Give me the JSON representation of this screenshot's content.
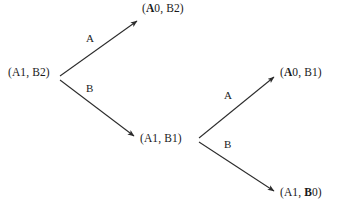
{
  "diagram": {
    "type": "decision-tree",
    "title": "",
    "line_color": "#2b2b2b",
    "text_color": "#1a1a1a",
    "background": "#ffffff",
    "nodes": [
      {
        "id": "root",
        "label": "(A1, B2)",
        "prefix": "(A1, B",
        "changed": "",
        "suffix": "2)",
        "x": 8,
        "y": 66,
        "role": "start-state"
      },
      {
        "id": "top",
        "label": "(A0, B2)",
        "prefix": "(",
        "changed": "A",
        "suffix": "0, B2)",
        "x": 142,
        "y": 2,
        "role": "terminal-state"
      },
      {
        "id": "middle",
        "label": "(A1, B1)",
        "prefix": "(A1, B",
        "changed": "",
        "suffix": "1)",
        "x": 140,
        "y": 132,
        "role": "intermediate-state"
      },
      {
        "id": "upper-right",
        "label": "(A0, B1)",
        "prefix": "(",
        "changed": "A",
        "suffix": "0, B1)",
        "x": 280,
        "y": 66,
        "role": "terminal-state"
      },
      {
        "id": "lower-right",
        "label": "(A1, B0)",
        "prefix": "(A1, ",
        "changed": "B",
        "suffix": "0)",
        "x": 280,
        "y": 186,
        "role": "terminal-state"
      }
    ],
    "edges": [
      {
        "id": "root-to-top",
        "action": "A",
        "from": "root",
        "to": "top",
        "x1": 60,
        "y1": 76,
        "x2": 137,
        "y2": 21,
        "label_x": 86,
        "label_y": 32
      },
      {
        "id": "root-to-middle",
        "action": "B",
        "from": "root",
        "to": "middle",
        "x1": 60,
        "y1": 80,
        "x2": 134,
        "y2": 136,
        "label_x": 86,
        "label_y": 82
      },
      {
        "id": "middle-to-upper-right",
        "action": "A",
        "from": "middle",
        "to": "upper-right",
        "x1": 199,
        "y1": 138,
        "x2": 274,
        "y2": 77,
        "label_x": 224,
        "label_y": 89
      },
      {
        "id": "middle-to-lower-right",
        "action": "B",
        "from": "middle",
        "to": "lower-right",
        "x1": 199,
        "y1": 142,
        "x2": 274,
        "y2": 191,
        "label_x": 224,
        "label_y": 138
      }
    ]
  }
}
